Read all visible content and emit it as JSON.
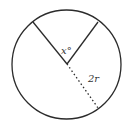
{
  "diagram": {
    "type": "circle-sector",
    "labels": {
      "angle": "x°",
      "radius": "2r"
    },
    "colors": {
      "stroke": "#2b2b2b",
      "text": "#333333",
      "background": "#ffffff"
    }
  }
}
